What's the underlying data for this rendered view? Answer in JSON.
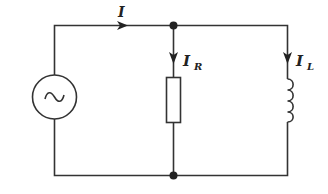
{
  "diagram": {
    "type": "circuit",
    "colors": {
      "line": "#333333",
      "label": "#222222",
      "background": "#ffffff"
    },
    "source": {
      "kind": "ac-voltage-source",
      "symbol": "~"
    },
    "currents": {
      "total": {
        "symbol": "I",
        "subscript": ""
      },
      "resistor": {
        "symbol": "I",
        "subscript": "R"
      },
      "inductor": {
        "symbol": "I",
        "subscript": "L"
      }
    },
    "components": [
      {
        "id": "source",
        "kind": "ac-source"
      },
      {
        "id": "resistor",
        "kind": "resistor"
      },
      {
        "id": "inductor",
        "kind": "inductor"
      }
    ],
    "junctions": 2
  }
}
